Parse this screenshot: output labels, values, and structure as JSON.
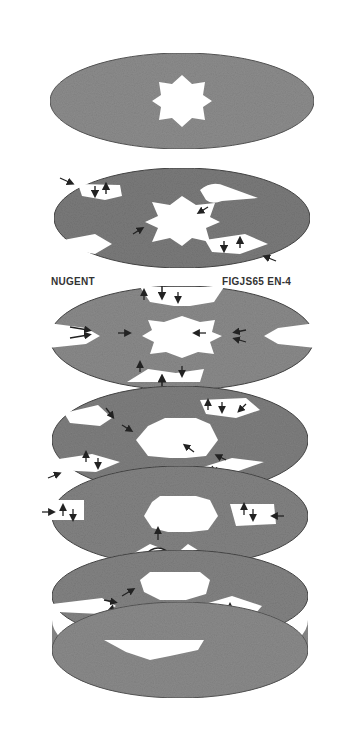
{
  "figure": {
    "label_left": "NUGENT",
    "label_right": "FIGJS65 EN-4",
    "colors": {
      "background": "#ffffff",
      "disk_fill": "#8a8a8a",
      "disk_edge": "#4a4a4a",
      "cutout": "#ffffff",
      "arrow": "#222222"
    },
    "disks": [
      {
        "id": 1,
        "description": "plain disk with eight-point star central opening"
      },
      {
        "id": 2,
        "description": "disk with star opening and four slotted cutouts with flow arrows"
      },
      {
        "id": 3,
        "description": "disk with star opening, side V-slots and top/bottom notches with arrows"
      },
      {
        "id": 4,
        "description": "disk with star opening and four diagonal slotted cutouts with arrows"
      },
      {
        "id": 5,
        "description": "disk with star opening, side pockets and bottom Y-shaped slot with arrows"
      },
      {
        "id": 6,
        "description": "disk with star opening and two slotted cutouts with arrows"
      },
      {
        "id": 7,
        "description": "plain bottom disk with star opening"
      }
    ]
  }
}
